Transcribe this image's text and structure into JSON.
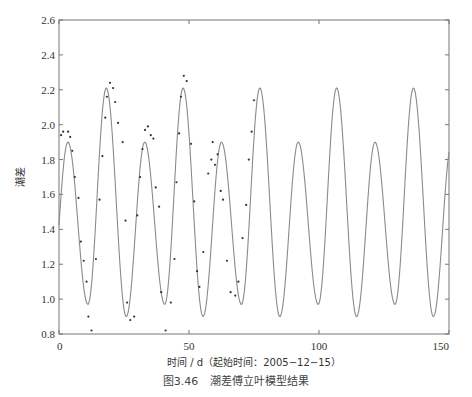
{
  "caption": {
    "figure_no": "图3.46",
    "title": "潮差傅立叶模型结果"
  },
  "chart_data": {
    "type": "line",
    "title": "",
    "xlabel": "时间 / d（起始时间：2005−12−15）",
    "ylabel": "潮差",
    "xlim": [
      0,
      150
    ],
    "ylim": [
      0.8,
      2.6
    ],
    "xticks": [
      0,
      50,
      100,
      150
    ],
    "xtick_labels": [
      "0",
      "50",
      "100",
      "150"
    ],
    "yticks": [
      0.8,
      1.0,
      1.2,
      1.4,
      1.6,
      1.8,
      2.0,
      2.2,
      2.4,
      2.6
    ],
    "ytick_labels": [
      "0.8",
      "1.0",
      "1.2",
      "1.4",
      "1.6",
      "1.8",
      "2.0",
      "2.2",
      "2.4",
      "2.6"
    ],
    "grid": false,
    "legend": "none",
    "series": [
      {
        "name": "傅立叶模型",
        "kind": "line",
        "color": "#8a8a8a",
        "model": {
          "period_days": 29.53,
          "first_major_peak_day": 18.2,
          "major_peak": 2.21,
          "minor_peak": 1.9,
          "major_trough": 0.9,
          "minor_trough": 0.97
        }
      },
      {
        "name": "实测值",
        "kind": "scatter",
        "color": "#333333",
        "x": [
          0.8,
          1.6,
          3.5,
          4.3,
          5.1,
          6.1,
          7.5,
          8.4,
          9.5,
          10.6,
          11.3,
          12.5,
          14.2,
          15.6,
          16.7,
          17.8,
          18.4,
          19.6,
          20.8,
          21.6,
          22.7,
          24.5,
          25.6,
          26.2,
          27.4,
          28.9,
          30.1,
          31.2,
          32.1,
          33.1,
          34.2,
          35.3,
          36.3,
          37.2,
          38.5,
          39.3,
          41.0,
          43.0,
          44.4,
          45.2,
          46.2,
          46.9,
          48.0,
          49.1,
          50.8,
          52.0,
          53.1,
          54.0,
          55.5,
          57.4,
          58.6,
          59.1,
          60.0,
          61.0,
          62.2,
          63.1,
          64.6,
          66.0,
          67.8,
          69.0,
          70.6,
          72.0,
          73.0,
          74.1,
          75.0
        ],
        "y": [
          1.94,
          1.96,
          1.96,
          1.93,
          1.85,
          1.7,
          1.58,
          1.33,
          1.22,
          1.1,
          0.9,
          0.82,
          1.23,
          1.57,
          1.82,
          2.04,
          2.16,
          2.24,
          2.21,
          2.13,
          2.01,
          1.9,
          1.45,
          0.98,
          0.88,
          0.9,
          1.48,
          1.7,
          1.86,
          1.97,
          1.99,
          1.94,
          1.92,
          1.64,
          1.53,
          1.04,
          0.82,
          0.98,
          1.23,
          1.67,
          1.95,
          2.16,
          2.28,
          2.25,
          1.89,
          1.56,
          1.16,
          1.07,
          1.27,
          1.72,
          1.8,
          1.9,
          1.77,
          1.83,
          1.62,
          1.57,
          1.22,
          1.04,
          1.02,
          1.1,
          1.35,
          1.54,
          1.8,
          1.96,
          2.14
        ]
      }
    ]
  }
}
